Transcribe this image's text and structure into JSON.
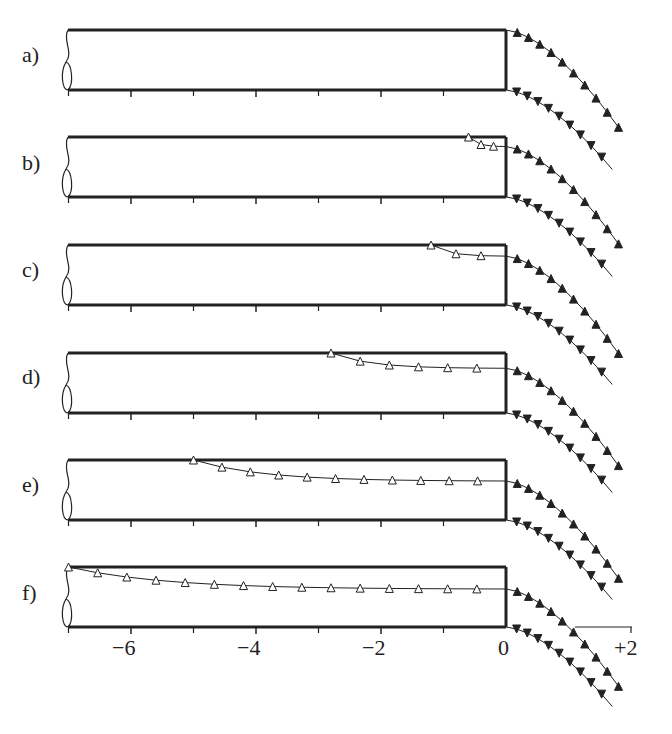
{
  "figure": {
    "type": "schematic free-surface profiles at cavity outlet",
    "panels": [
      {
        "id": "a",
        "label": "a)",
        "top_profile_start_x": 0.0,
        "description": "free streamlines leave at edge x=0"
      },
      {
        "id": "b",
        "label": "b)",
        "top_profile_start_x": -0.6,
        "description": "upper profile detaches slightly upstream"
      },
      {
        "id": "c",
        "label": "c)",
        "top_profile_start_x": -1.2,
        "description": "upper profile starts at x≈-1.2"
      },
      {
        "id": "d",
        "label": "d)",
        "top_profile_start_x": -2.8,
        "description": "upper profile starts at x≈-2.8"
      },
      {
        "id": "e",
        "label": "e)",
        "top_profile_start_x": -5.0,
        "description": "upper profile starts at x≈-5"
      },
      {
        "id": "f",
        "label": "f)",
        "top_profile_start_x": -7.0,
        "description": "upper profile spans whole duct"
      }
    ],
    "x_axis": {
      "ticks": [
        "−6",
        "−4",
        "−2",
        "0",
        "+2"
      ],
      "tick_values": [
        -6,
        -4,
        -2,
        0,
        2
      ]
    },
    "markers": {
      "inside": "open-triangle",
      "outside": "filled-triangle"
    },
    "colors": {
      "stroke": "#222222",
      "marker_open": "#ffffff",
      "background": "#ffffff"
    }
  },
  "background_text": [
    "Figure with numerical values of the free-surface shape",
    "Evoluzione sperimentalmente il profilo libero",
    "Profili/forme della vena"
  ]
}
